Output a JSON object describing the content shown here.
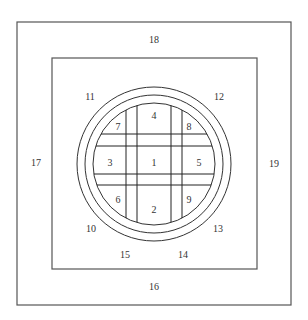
{
  "diagram": {
    "colors": {
      "stroke": "#555555",
      "label": "#333333",
      "background": "#ffffff"
    },
    "labels": {
      "l1": "1",
      "l2": "2",
      "l3": "3",
      "l4": "4",
      "l5": "5",
      "l6": "6",
      "l7": "7",
      "l8": "8",
      "l9": "9",
      "l10": "10",
      "l11": "11",
      "l12": "12",
      "l13": "13",
      "l14": "14",
      "l15": "15",
      "l16": "16",
      "l17": "17",
      "l18": "18",
      "l19": "19"
    }
  }
}
